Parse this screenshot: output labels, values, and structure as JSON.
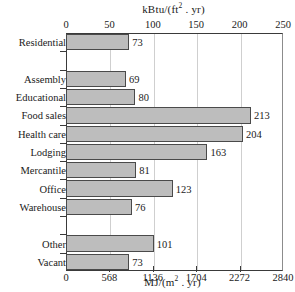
{
  "chart_data": {
    "type": "bar",
    "orientation": "horizontal",
    "title": "kBtu/(ft2 . yr)",
    "title_top": "kBtu/(ft2 . yr)",
    "title_bottom": "MJ/(m2 . yr)",
    "xlabel": "kBtu/(ft2 . yr)",
    "xlabel_secondary": "MJ/(m2 . yr)",
    "ylabel": "",
    "grid": true,
    "legend": null,
    "xlim": [
      0,
      250
    ],
    "xlim_secondary": [
      0,
      2840
    ],
    "xticks": [
      0,
      50,
      100,
      150,
      200,
      250
    ],
    "xticks_secondary": [
      0,
      568,
      1136,
      1704,
      2272,
      2840
    ],
    "categories": [
      "Residential",
      "Assembly",
      "Educational",
      "Food sales",
      "Health care",
      "Lodging",
      "Mercantile",
      "Office",
      "Warehouse",
      "Other",
      "Vacant"
    ],
    "values": [
      73,
      69,
      80,
      213,
      204,
      163,
      81,
      123,
      76,
      101,
      73
    ],
    "bar_color": "#bdbdbd",
    "bar_edge_color": "#4a4a4a",
    "grid_color": "#cfcfcf",
    "axis_color": "#3a3a3a",
    "slots": [
      {
        "category": "Residential",
        "value": 73,
        "empty": false
      },
      {
        "category": "",
        "value": null,
        "empty": true
      },
      {
        "category": "Assembly",
        "value": 69,
        "empty": false
      },
      {
        "category": "Educational",
        "value": 80,
        "empty": false
      },
      {
        "category": "Food sales",
        "value": 213,
        "empty": false
      },
      {
        "category": "Health care",
        "value": 204,
        "empty": false
      },
      {
        "category": "Lodging",
        "value": 163,
        "empty": false
      },
      {
        "category": "Mercantile",
        "value": 81,
        "empty": false
      },
      {
        "category": "Office",
        "value": 123,
        "empty": false
      },
      {
        "category": "Warehouse",
        "value": 76,
        "empty": false
      },
      {
        "category": "",
        "value": null,
        "empty": true
      },
      {
        "category": "Other",
        "value": 101,
        "empty": false
      },
      {
        "category": "Vacant",
        "value": 73,
        "empty": false
      }
    ]
  },
  "axis_top": {
    "unit_prefix": "kBtu/(ft",
    "unit_exp": "2",
    "unit_suffix": " . yr)",
    "labels": [
      "0",
      "50",
      "100",
      "150",
      "200",
      "250"
    ]
  },
  "axis_bottom": {
    "unit_prefix": "MJ/(m",
    "unit_exp": "2",
    "unit_suffix": " . yr)",
    "labels": [
      "0",
      "568",
      "1136",
      "1704",
      "2272",
      "2840"
    ]
  }
}
